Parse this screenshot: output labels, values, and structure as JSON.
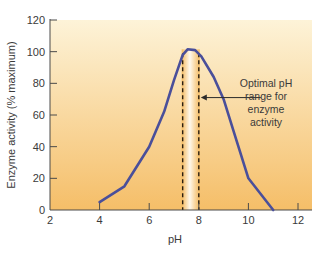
{
  "chart_data": {
    "type": "line",
    "title": "",
    "xlabel": "pH",
    "ylabel": "Enzyme activity (% maximum)",
    "xlim": [
      2,
      12.3
    ],
    "ylim": [
      0,
      120
    ],
    "xticks": [
      2,
      4,
      6,
      8,
      10,
      12
    ],
    "yticks": [
      0,
      20,
      40,
      60,
      80,
      100,
      120
    ],
    "grid": false,
    "legend": null,
    "series": [
      {
        "name": "Enzyme activity",
        "color": "#4a4f9a",
        "x": [
          4,
          5,
          6,
          6.6,
          7,
          7.35,
          7.55,
          7.85,
          8.1,
          8.6,
          9,
          9.5,
          10,
          11
        ],
        "y": [
          5,
          15,
          40,
          62,
          82,
          98,
          101.5,
          101,
          97,
          84,
          70,
          45,
          20,
          0
        ]
      }
    ],
    "annotations": [
      {
        "text_lines": [
          "Optimal pH",
          "range for",
          "enzyme",
          "activity"
        ],
        "arrow_to_x": 8.0,
        "arrow_to_y": 71
      }
    ],
    "optimal_range": [
      7.35,
      8.0
    ],
    "background_gradient": {
      "top": "#fdf3d8",
      "bottom": "#f5be68"
    },
    "optimal_band_color": "#fffaf0"
  },
  "labels": {
    "xlabel": "pH",
    "ylabel": "Enzyme activity (% maximum)",
    "annotation": [
      "Optimal pH",
      "range for",
      "enzyme",
      "activity"
    ]
  }
}
